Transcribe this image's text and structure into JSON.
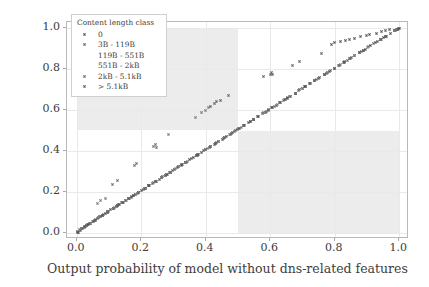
{
  "chart_data": {
    "type": "scatter",
    "title": "",
    "xlabel": "Output probability of model without dns-related features",
    "ylabel": "Output probability of complete model",
    "xlim": [
      -0.03,
      1.03
    ],
    "ylim": [
      -0.03,
      1.03
    ],
    "xticks": [
      "0.0",
      "0.2",
      "0.4",
      "0.6",
      "0.8",
      "1.0"
    ],
    "xtick_values": [
      0.0,
      0.2,
      0.4,
      0.6,
      0.8,
      1.0
    ],
    "yticks": [
      "0.0",
      "0.2",
      "0.4",
      "0.6",
      "0.8",
      "1.0"
    ],
    "ytick_values": [
      0.0,
      0.2,
      0.4,
      0.6,
      0.8,
      1.0
    ],
    "grid": true,
    "legend_position": "upper left",
    "shaded_regions": [
      {
        "name": "disagreement-top-left",
        "x": [
          0.0,
          0.5
        ],
        "y": [
          0.5,
          1.0
        ],
        "color": "#ececed"
      },
      {
        "name": "disagreement-bottom-right",
        "x": [
          0.5,
          1.0
        ],
        "y": [
          0.0,
          0.5
        ],
        "color": "#ececed"
      }
    ],
    "legend": {
      "title": "Content length class",
      "entries": [
        {
          "label": "0",
          "color": "#4f4f4f",
          "marker": "x"
        },
        {
          "label": "3B - 119B",
          "color": "#5a5a5a",
          "marker": "x"
        },
        {
          "label": "119B - 551B",
          "color": "#6b6b6b",
          "marker": "x"
        },
        {
          "label": "551B - 2kB",
          "color": "#7a7a7a",
          "marker": "x"
        },
        {
          "label": "2kB - 5.1kB",
          "color": "#626262",
          "marker": "x"
        },
        {
          "label": "> 5.1kB",
          "color": "#555555",
          "marker": "x"
        }
      ]
    },
    "series": [
      {
        "name": "0",
        "color": "#4f4f4f",
        "points": [
          [
            0.002,
            0.003
          ],
          [
            0.006,
            0.004
          ],
          [
            0.011,
            0.012
          ],
          [
            0.018,
            0.02
          ],
          [
            0.024,
            0.027
          ],
          [
            0.031,
            0.034
          ],
          [
            0.037,
            0.04
          ],
          [
            0.044,
            0.047
          ],
          [
            0.051,
            0.054
          ],
          [
            0.058,
            0.062
          ],
          [
            0.066,
            0.07
          ],
          [
            0.073,
            0.078
          ],
          [
            0.081,
            0.086
          ],
          [
            0.089,
            0.094
          ],
          [
            0.097,
            0.103
          ],
          [
            0.106,
            0.112
          ],
          [
            0.115,
            0.121
          ],
          [
            0.124,
            0.13
          ],
          [
            0.133,
            0.139
          ],
          [
            0.142,
            0.148
          ],
          [
            0.152,
            0.158
          ],
          [
            0.161,
            0.167
          ],
          [
            0.171,
            0.177
          ],
          [
            0.181,
            0.187
          ],
          [
            0.191,
            0.197
          ],
          [
            0.202,
            0.208
          ],
          [
            0.212,
            0.218
          ],
          [
            0.223,
            0.229
          ],
          [
            0.234,
            0.24
          ],
          [
            0.245,
            0.251
          ],
          [
            0.256,
            0.262
          ],
          [
            0.267,
            0.273
          ],
          [
            0.279,
            0.285
          ],
          [
            0.29,
            0.296
          ],
          [
            0.302,
            0.308
          ],
          [
            0.314,
            0.32
          ],
          [
            0.326,
            0.332
          ],
          [
            0.338,
            0.344
          ],
          [
            0.35,
            0.356
          ],
          [
            0.362,
            0.368
          ],
          [
            0.375,
            0.381
          ],
          [
            0.387,
            0.393
          ],
          [
            0.4,
            0.406
          ],
          [
            0.413,
            0.419
          ],
          [
            0.426,
            0.432
          ],
          [
            0.439,
            0.445
          ],
          [
            0.452,
            0.458
          ],
          [
            0.465,
            0.471
          ],
          [
            0.479,
            0.485
          ],
          [
            0.492,
            0.498
          ],
          [
            0.506,
            0.512
          ],
          [
            0.519,
            0.525
          ],
          [
            0.533,
            0.539
          ],
          [
            0.547,
            0.553
          ],
          [
            0.561,
            0.567
          ],
          [
            0.575,
            0.581
          ],
          [
            0.589,
            0.595
          ],
          [
            0.604,
            0.61
          ],
          [
            0.618,
            0.624
          ],
          [
            0.633,
            0.639
          ],
          [
            0.647,
            0.653
          ],
          [
            0.662,
            0.668
          ],
          [
            0.677,
            0.683
          ],
          [
            0.692,
            0.698
          ],
          [
            0.707,
            0.713
          ],
          [
            0.722,
            0.728
          ],
          [
            0.737,
            0.743
          ],
          [
            0.752,
            0.758
          ],
          [
            0.768,
            0.773
          ],
          [
            0.783,
            0.788
          ],
          [
            0.799,
            0.804
          ],
          [
            0.814,
            0.819
          ],
          [
            0.83,
            0.835
          ],
          [
            0.846,
            0.85
          ],
          [
            0.862,
            0.866
          ],
          [
            0.878,
            0.882
          ],
          [
            0.894,
            0.898
          ],
          [
            0.91,
            0.913
          ],
          [
            0.926,
            0.929
          ],
          [
            0.942,
            0.945
          ],
          [
            0.958,
            0.961
          ],
          [
            0.974,
            0.976
          ],
          [
            0.986,
            0.988
          ],
          [
            0.994,
            0.995
          ],
          [
            0.999,
            0.999
          ]
        ]
      },
      {
        "name": "3B - 119B",
        "color": "#5a5a5a",
        "points": [
          [
            0.004,
            0.008
          ],
          [
            0.014,
            0.019
          ],
          [
            0.027,
            0.032
          ],
          [
            0.04,
            0.046
          ],
          [
            0.054,
            0.06
          ],
          [
            0.068,
            0.074
          ],
          [
            0.083,
            0.089
          ],
          [
            0.098,
            0.104
          ],
          [
            0.113,
            0.119
          ],
          [
            0.128,
            0.134
          ],
          [
            0.144,
            0.15
          ],
          [
            0.16,
            0.166
          ],
          [
            0.176,
            0.182
          ],
          [
            0.193,
            0.199
          ],
          [
            0.21,
            0.216
          ],
          [
            0.227,
            0.233
          ],
          [
            0.244,
            0.25
          ],
          [
            0.262,
            0.268
          ],
          [
            0.28,
            0.286
          ],
          [
            0.298,
            0.304
          ],
          [
            0.317,
            0.323
          ],
          [
            0.336,
            0.342
          ],
          [
            0.355,
            0.361
          ],
          [
            0.374,
            0.38
          ],
          [
            0.394,
            0.4
          ],
          [
            0.414,
            0.42
          ],
          [
            0.434,
            0.44
          ],
          [
            0.455,
            0.461
          ],
          [
            0.476,
            0.482
          ],
          [
            0.497,
            0.503
          ],
          [
            0.518,
            0.524
          ],
          [
            0.54,
            0.546
          ],
          [
            0.562,
            0.568
          ],
          [
            0.584,
            0.59
          ],
          [
            0.607,
            0.613
          ],
          [
            0.63,
            0.636
          ],
          [
            0.653,
            0.659
          ],
          [
            0.677,
            0.682
          ],
          [
            0.701,
            0.706
          ],
          [
            0.725,
            0.73
          ],
          [
            0.75,
            0.755
          ],
          [
            0.775,
            0.78
          ],
          [
            0.8,
            0.805
          ],
          [
            0.826,
            0.83
          ],
          [
            0.852,
            0.856
          ],
          [
            0.878,
            0.882
          ],
          [
            0.905,
            0.908
          ],
          [
            0.932,
            0.935
          ],
          [
            0.959,
            0.961
          ],
          [
            0.986,
            0.988
          ]
        ]
      },
      {
        "name": "119B - 551B",
        "color": "#6b6b6b",
        "points": [
          [
            0.009,
            0.014
          ],
          [
            0.029,
            0.035
          ],
          [
            0.05,
            0.056
          ],
          [
            0.072,
            0.078
          ],
          [
            0.094,
            0.1
          ],
          [
            0.117,
            0.123
          ],
          [
            0.14,
            0.146
          ],
          [
            0.164,
            0.17
          ],
          [
            0.188,
            0.194
          ],
          [
            0.213,
            0.219
          ],
          [
            0.238,
            0.244
          ],
          [
            0.264,
            0.27
          ],
          [
            0.29,
            0.296
          ],
          [
            0.317,
            0.323
          ],
          [
            0.344,
            0.35
          ],
          [
            0.372,
            0.378
          ],
          [
            0.4,
            0.406
          ],
          [
            0.429,
            0.435
          ],
          [
            0.458,
            0.464
          ],
          [
            0.488,
            0.494
          ],
          [
            0.518,
            0.524
          ],
          [
            0.549,
            0.555
          ],
          [
            0.58,
            0.586
          ],
          [
            0.612,
            0.618
          ],
          [
            0.644,
            0.65
          ],
          [
            0.677,
            0.683
          ],
          [
            0.71,
            0.715
          ],
          [
            0.744,
            0.749
          ],
          [
            0.778,
            0.783
          ],
          [
            0.813,
            0.817
          ],
          [
            0.848,
            0.852
          ],
          [
            0.884,
            0.887
          ],
          [
            0.92,
            0.923
          ],
          [
            0.956,
            0.958
          ],
          [
            0.992,
            0.993
          ],
          [
            0.112,
            0.236
          ],
          [
            0.128,
            0.255
          ],
          [
            0.178,
            0.328
          ],
          [
            0.186,
            0.34
          ],
          [
            0.238,
            0.424
          ],
          [
            0.244,
            0.432
          ],
          [
            0.248,
            0.415
          ]
        ]
      },
      {
        "name": "551B - 2kB",
        "color": "#7a7a7a",
        "points": [
          [
            0.016,
            0.022
          ],
          [
            0.042,
            0.048
          ],
          [
            0.069,
            0.075
          ],
          [
            0.096,
            0.102
          ],
          [
            0.124,
            0.13
          ],
          [
            0.153,
            0.159
          ],
          [
            0.182,
            0.188
          ],
          [
            0.212,
            0.218
          ],
          [
            0.243,
            0.249
          ],
          [
            0.274,
            0.28
          ],
          [
            0.306,
            0.312
          ],
          [
            0.339,
            0.345
          ],
          [
            0.372,
            0.378
          ],
          [
            0.406,
            0.412
          ],
          [
            0.44,
            0.446
          ],
          [
            0.475,
            0.481
          ],
          [
            0.511,
            0.517
          ],
          [
            0.547,
            0.553
          ],
          [
            0.584,
            0.59
          ],
          [
            0.622,
            0.627
          ],
          [
            0.66,
            0.665
          ],
          [
            0.699,
            0.704
          ],
          [
            0.738,
            0.743
          ],
          [
            0.778,
            0.783
          ],
          [
            0.819,
            0.823
          ],
          [
            0.86,
            0.864
          ],
          [
            0.902,
            0.905
          ],
          [
            0.944,
            0.946
          ],
          [
            0.987,
            0.988
          ],
          [
            0.064,
            0.141
          ],
          [
            0.075,
            0.158
          ],
          [
            0.088,
            0.17
          ],
          [
            0.286,
            0.48
          ],
          [
            0.368,
            0.563
          ],
          [
            0.388,
            0.586
          ],
          [
            0.4,
            0.6
          ],
          [
            0.408,
            0.612
          ]
        ]
      },
      {
        "name": "2kB - 5.1kB",
        "color": "#626262",
        "points": [
          [
            0.023,
            0.029
          ],
          [
            0.058,
            0.064
          ],
          [
            0.094,
            0.1
          ],
          [
            0.131,
            0.137
          ],
          [
            0.169,
            0.175
          ],
          [
            0.208,
            0.214
          ],
          [
            0.247,
            0.253
          ],
          [
            0.288,
            0.294
          ],
          [
            0.329,
            0.335
          ],
          [
            0.371,
            0.377
          ],
          [
            0.414,
            0.42
          ],
          [
            0.458,
            0.464
          ],
          [
            0.502,
            0.508
          ],
          [
            0.548,
            0.554
          ],
          [
            0.594,
            0.6
          ],
          [
            0.641,
            0.646
          ],
          [
            0.689,
            0.694
          ],
          [
            0.738,
            0.743
          ],
          [
            0.787,
            0.792
          ],
          [
            0.838,
            0.842
          ],
          [
            0.889,
            0.892
          ],
          [
            0.941,
            0.943
          ],
          [
            0.993,
            0.994
          ],
          [
            0.414,
            0.618
          ],
          [
            0.428,
            0.634
          ],
          [
            0.432,
            0.641
          ],
          [
            0.446,
            0.648
          ],
          [
            0.47,
            0.672
          ],
          [
            0.578,
            0.763
          ],
          [
            0.6,
            0.772
          ],
          [
            0.604,
            0.782
          ],
          [
            0.608,
            0.775
          ],
          [
            0.668,
            0.818
          ],
          [
            0.692,
            0.838
          ],
          [
            0.76,
            0.875
          ]
        ]
      },
      {
        "name": "> 5.1kB",
        "color": "#555555",
        "points": [
          [
            0.034,
            0.04
          ],
          [
            0.08,
            0.086
          ],
          [
            0.127,
            0.133
          ],
          [
            0.175,
            0.181
          ],
          [
            0.224,
            0.23
          ],
          [
            0.274,
            0.28
          ],
          [
            0.325,
            0.331
          ],
          [
            0.377,
            0.383
          ],
          [
            0.43,
            0.436
          ],
          [
            0.484,
            0.49
          ],
          [
            0.539,
            0.545
          ],
          [
            0.595,
            0.601
          ],
          [
            0.652,
            0.657
          ],
          [
            0.71,
            0.715
          ],
          [
            0.769,
            0.774
          ],
          [
            0.829,
            0.833
          ],
          [
            0.89,
            0.893
          ],
          [
            0.952,
            0.954
          ],
          [
            0.997,
            0.998
          ],
          [
            0.79,
            0.92
          ],
          [
            0.8,
            0.928
          ],
          [
            0.818,
            0.934
          ],
          [
            0.832,
            0.938
          ],
          [
            0.846,
            0.944
          ],
          [
            0.862,
            0.95
          ],
          [
            0.88,
            0.958
          ],
          [
            0.898,
            0.962
          ],
          [
            0.908,
            0.968
          ],
          [
            0.928,
            0.976
          ],
          [
            0.944,
            0.984
          ],
          [
            0.958,
            0.988
          ],
          [
            0.968,
            0.992
          ]
        ]
      }
    ]
  }
}
